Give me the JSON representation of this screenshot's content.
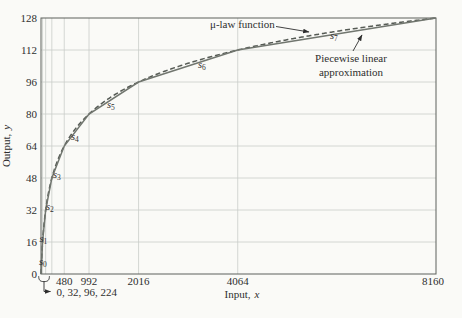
{
  "figure": {
    "background": "#fafaf7",
    "text_color": "#2e2e2e",
    "grid_color": "#c9cdc9",
    "border_color": "#5c615c",
    "mu_curve_color": "#565b55",
    "piecewise_curve_color": "#71766f"
  },
  "chart_data": {
    "type": "line",
    "title": "",
    "xlabel": {
      "main": "Input,",
      "var": "x"
    },
    "ylabel": {
      "main": "Output,",
      "var": "y"
    },
    "xlim": [
      0,
      8160
    ],
    "ylim": [
      0,
      128
    ],
    "x_tick_labels": [
      480,
      992,
      2016,
      4064,
      8160
    ],
    "x_gridlines": [
      32,
      96,
      224,
      480,
      992,
      2016,
      4064
    ],
    "y_ticks": [
      0,
      16,
      32,
      48,
      64,
      80,
      96,
      112,
      128
    ],
    "grid": true,
    "legend_position": "top-right annotations with arrows",
    "series": [
      {
        "name": "μ-law function",
        "style": "dashed",
        "formula": "y = 128·ln(1 + μx/8160)/ln(1 + μ)",
        "mu": 255,
        "x_max": 8160,
        "y_max": 128
      },
      {
        "name": "Piecewise linear approximation",
        "style": "solid",
        "points": [
          [
            0,
            0
          ],
          [
            32,
            16
          ],
          [
            96,
            32
          ],
          [
            224,
            48
          ],
          [
            480,
            64
          ],
          [
            992,
            80
          ],
          [
            2016,
            96
          ],
          [
            4064,
            112
          ],
          [
            8160,
            128
          ]
        ]
      }
    ],
    "segments": [
      {
        "base": "s",
        "sub": "0"
      },
      {
        "base": "s",
        "sub": "1"
      },
      {
        "base": "s",
        "sub": "2"
      },
      {
        "base": "s",
        "sub": "3"
      },
      {
        "base": "s",
        "sub": "4"
      },
      {
        "base": "s",
        "sub": "5"
      },
      {
        "base": "s",
        "sub": "6"
      },
      {
        "base": "s",
        "sub": "7"
      }
    ],
    "annotations": {
      "mu_label": "μ-law function",
      "pw_label_line1": "Piecewise linear",
      "pw_label_line2": "approximation",
      "origin_ticks_label": "0, 32, 96, 224"
    }
  }
}
